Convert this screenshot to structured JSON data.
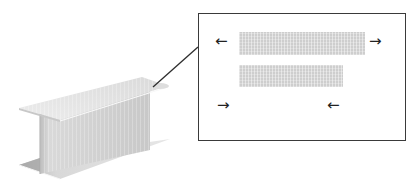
{
  "diagram": {
    "colors": {
      "background": "#ffffff",
      "flange_top": "#e2e2e2",
      "flange_edge": "#f4f4f4",
      "web": "#cfcfcf",
      "web_shadow": "#bdbdbd",
      "flange_bottom": "#dcdcdc",
      "flange_bottom_shadow": "#b4b4b4",
      "leader_line": "#2e2e2e",
      "box_border": "#3a3a3a",
      "redacted_bar": "#d6d6d6",
      "arrow": "#222222"
    },
    "callout": {
      "bars": [
        {
          "label": "",
          "x": 239,
          "y": 32,
          "w": 126,
          "h": 23
        },
        {
          "label": "",
          "x": 239,
          "y": 65,
          "w": 104,
          "h": 22
        }
      ],
      "arrows": [
        {
          "glyph": "←",
          "direction": "left",
          "x": 215,
          "y": 34
        },
        {
          "glyph": "→",
          "direction": "right",
          "x": 369,
          "y": 34
        },
        {
          "glyph": "→",
          "direction": "right",
          "x": 217,
          "y": 98
        },
        {
          "glyph": "←",
          "direction": "left",
          "x": 327,
          "y": 98
        }
      ],
      "faint_label": ""
    }
  }
}
